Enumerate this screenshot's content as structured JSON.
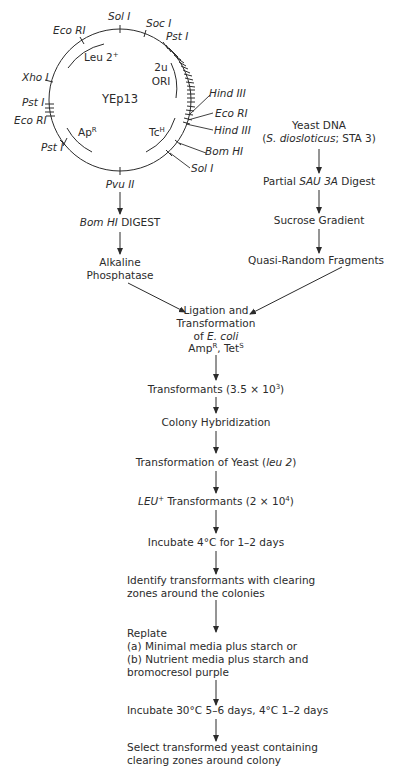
{
  "plasmid": {
    "name": "YEp13",
    "sites": {
      "top": "Sol I",
      "top_right_1": "Soc I",
      "top_right_2": "Pst I",
      "top_left": "Eco RI",
      "left_1": "Xho I",
      "left_2": "Pst I",
      "left_3": "Eco RI",
      "bottom_left": "Pst I",
      "bottom": "Pvu II",
      "right_1": "Hind III",
      "right_2": "Eco RI",
      "right_3": "Hind III",
      "right_4": "Bom HI",
      "right_5": "Sol I"
    },
    "genes": {
      "leu": "Leu 2",
      "leu_sup": "+",
      "ori_1": "2u",
      "ori_2": "ORI",
      "amp": "Ap",
      "amp_sup": "R",
      "tet": "Tc",
      "tet_sup": "H"
    }
  },
  "left_branch": {
    "step1_italic": "Bom HI",
    "step1_rest": " DIGEST",
    "step2_line1": "Alkaline",
    "step2_line2": "Phosphatase"
  },
  "right_branch": {
    "title": "Yeast DNA",
    "source_open": "(",
    "source_species": "S. diosloticus",
    "source_rest": "; STA 3)",
    "step1_pre": "Partial ",
    "step1_italic": "SAU 3A",
    "step1_post": " Digest",
    "step2": "Sucrose Gradient",
    "step3": "Quasi-Random Fragments"
  },
  "flow": {
    "ligation_1": "Ligation and",
    "ligation_2": "Transformation",
    "ligation_3_pre": "of ",
    "ligation_3_italic": "E. coli",
    "ligation_4_amp": "Amp",
    "ligation_4_amp_sup": "R",
    "ligation_4_mid": ", Tet",
    "ligation_4_tet_sup": "S",
    "transformants": "Transformants (3.5 × 10",
    "transformants_exp": "3",
    "transformants_close": ")",
    "colony": "Colony Hybridization",
    "yeast_pre": "Transformation of Yeast (",
    "yeast_italic": "leu 2",
    "yeast_close": ")",
    "leu_italic": "LEU",
    "leu_sup": "+",
    "leu_rest": " Transformants (2 × 10",
    "leu_exp": "4",
    "leu_close": ")",
    "incubate1": "Incubate 4°C for 1–2 days",
    "identify_1": "Identify transformants with clearing",
    "identify_2": "zones around the colonies",
    "replate_0": "Replate",
    "replate_a": "(a) Minimal media plus starch or",
    "replate_b": "(b) Nutrient media plus starch and",
    "replate_c": "bromocresol purple",
    "incubate2": "Incubate 30°C 5–6 days, 4°C 1–2 days",
    "select_1": "Select transformed yeast containing",
    "select_2": "clearing zones around colony"
  },
  "colors": {
    "ink": "#2b2b2b",
    "background": "#ffffff"
  }
}
